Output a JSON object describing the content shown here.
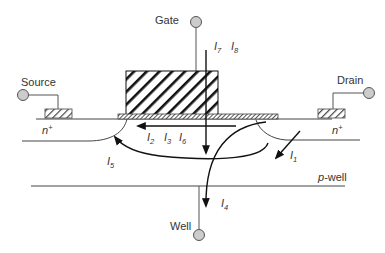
{
  "diagram": {
    "terminals": {
      "gate": "Gate",
      "source": "Source",
      "drain": "Drain",
      "well": "Well"
    },
    "regions": {
      "source_diffusion": "n",
      "source_diffusion_sup": "+",
      "drain_diffusion": "n",
      "drain_diffusion_sup": "+",
      "well_italic": "p",
      "well_rest": "-well"
    },
    "currents": [
      {
        "id": "I1",
        "letter": "I",
        "sub": "1"
      },
      {
        "id": "I2",
        "letter": "I",
        "sub": "2"
      },
      {
        "id": "I3",
        "letter": "I",
        "sub": "3"
      },
      {
        "id": "I4",
        "letter": "I",
        "sub": "4"
      },
      {
        "id": "I5",
        "letter": "I",
        "sub": "5"
      },
      {
        "id": "I6",
        "letter": "I",
        "sub": "6"
      },
      {
        "id": "I7",
        "letter": "I",
        "sub": "7"
      },
      {
        "id": "I8",
        "letter": "I",
        "sub": "8"
      }
    ],
    "colors": {
      "terminal_fill": "#cccccc",
      "stroke": "#444444",
      "arrow": "#111111",
      "text": "#333333"
    }
  }
}
